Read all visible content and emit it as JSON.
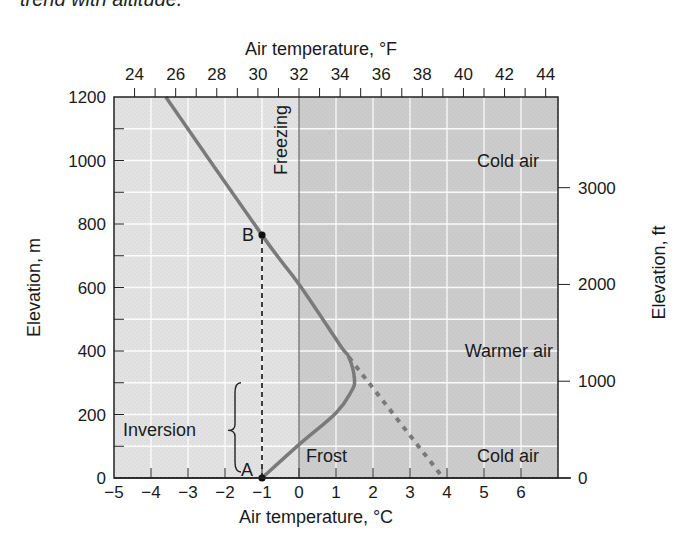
{
  "caption": "trend with altitude.",
  "chart_data": {
    "type": "line",
    "title": "",
    "xlabel": "Air temperature, °C",
    "x2label": "Air temperature, °F",
    "ylabel": "Elevation, m",
    "y2label": "Elevation, ft",
    "xlim": [
      -5,
      7
    ],
    "ylim": [
      0,
      1200
    ],
    "grid": true,
    "x_ticks": [
      -5,
      -4,
      -3,
      -2,
      -1,
      0,
      1,
      2,
      3,
      4,
      5,
      6
    ],
    "x_tick_labels": [
      "−5",
      "−4",
      "−3",
      "−2",
      "−1",
      "0",
      "1",
      "2",
      "3",
      "4",
      "5",
      "6"
    ],
    "x2_ticks_F": [
      24,
      26,
      28,
      30,
      32,
      34,
      36,
      38,
      40,
      42,
      44
    ],
    "y_ticks": [
      0,
      200,
      400,
      600,
      800,
      1000,
      1200
    ],
    "y2_ticks_ft": [
      0,
      1000,
      2000,
      3000
    ],
    "series": [
      {
        "name": "Temperature profile (inversion)",
        "style": "solid",
        "color": "#7a7a7a",
        "points": [
          [
            -1.0,
            0
          ],
          [
            0.0,
            105
          ],
          [
            1.0,
            205
          ],
          [
            1.4,
            270
          ],
          [
            1.5,
            310
          ],
          [
            1.35,
            380
          ],
          [
            1.1,
            420
          ],
          [
            0.0,
            610
          ],
          [
            -1.0,
            765
          ],
          [
            -3.6,
            1200
          ]
        ]
      },
      {
        "name": "Normal lapse extension",
        "style": "dashed",
        "color": "#7a7a7a",
        "points": [
          [
            1.35,
            380
          ],
          [
            3.9,
            0
          ]
        ]
      },
      {
        "name": "A-B vertical",
        "style": "dashed",
        "color": "#111111",
        "points": [
          [
            -1.0,
            0
          ],
          [
            -1.0,
            765
          ]
        ]
      }
    ],
    "points": [
      {
        "label": "A",
        "x": -1.0,
        "y": 0
      },
      {
        "label": "B",
        "x": -1.0,
        "y": 765
      }
    ],
    "annotations": [
      {
        "text": "Freezing",
        "x": -0.35,
        "y": 1080,
        "rotated": true
      },
      {
        "text": "Cold air",
        "x": 4.8,
        "y": 1000
      },
      {
        "text": "Warmer air",
        "x": 4.8,
        "y": 400
      },
      {
        "text": "Frost",
        "x": 0.9,
        "y": 70
      },
      {
        "text": "Cold air",
        "x": 4.8,
        "y": 70
      },
      {
        "text": "Inversion",
        "x": -3.1,
        "y": 150,
        "brace": true
      }
    ],
    "regions": [
      {
        "name": "below-freezing",
        "x_from": -5,
        "x_to": 0,
        "color": "#e2e2e2"
      },
      {
        "name": "above-freezing",
        "x_from": 0,
        "x_to": 7,
        "color": "#cccccc"
      }
    ]
  }
}
